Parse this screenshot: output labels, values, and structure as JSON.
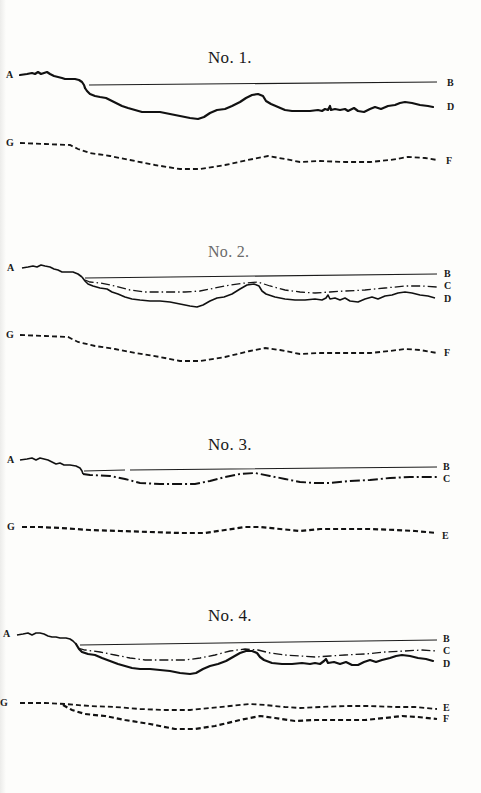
{
  "figures": [
    {
      "id": "no1",
      "title": "No. 1.",
      "labels": {
        "A": "A",
        "B": "B",
        "D": "D",
        "G": "G",
        "F": "F"
      },
      "curves": [
        "A-B straight line",
        "A-D solid profile",
        "G-F dashed"
      ]
    },
    {
      "id": "no2",
      "title": "No. 2.",
      "labels": {
        "A": "A",
        "B": "B",
        "C": "C",
        "D": "D",
        "G": "G",
        "F": "F"
      },
      "curves": [
        "A-B straight line",
        "C dash-dot",
        "D solid profile",
        "G-F dashed"
      ]
    },
    {
      "id": "no3",
      "title": "No. 3.",
      "labels": {
        "A": "A",
        "B": "B",
        "C": "C",
        "G": "G",
        "E": "E"
      },
      "curves": [
        "A-B straight line",
        "C dash-dot",
        "G-E dashed"
      ]
    },
    {
      "id": "no4",
      "title": "No. 4.",
      "labels": {
        "A": "A",
        "B": "B",
        "C": "C",
        "D": "D",
        "G": "G",
        "E": "E",
        "F": "F"
      },
      "curves": [
        "A-B straight line",
        "C dash-dot",
        "D solid profile",
        "G-E dashed",
        "G-F dashed"
      ]
    }
  ]
}
